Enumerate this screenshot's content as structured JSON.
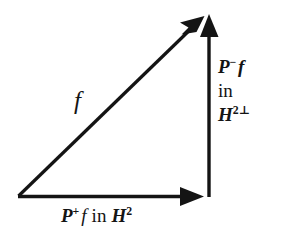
{
  "figure": {
    "type": "vector-triangle-diagram",
    "width": 290,
    "height": 241,
    "background_color": "#ffffff",
    "stroke_color": "#141414"
  },
  "geometry": {
    "origin": {
      "x": 18,
      "y": 196
    },
    "corner": {
      "x": 209,
      "y": 196
    },
    "apex": {
      "x": 209,
      "y": 15
    },
    "base_arrow_tip": {
      "x": 204,
      "y": 196
    },
    "vertical_arrow_tip": {
      "x": 209,
      "y": 14
    },
    "hypotenuse_arrow_tip": {
      "x": 204,
      "y": 16
    },
    "line_width": 3
  },
  "labels": {
    "hypotenuse": {
      "text": "f",
      "operator": "f",
      "style": "italic"
    },
    "base": {
      "full_text": "P+f in H2",
      "operator": "P",
      "operator_superscript": "+",
      "function": "f",
      "preposition": "in",
      "space": "H",
      "space_superscript": "2"
    },
    "vertical": {
      "full_text": "P-f in H2⊥",
      "line1_operator": "P",
      "line1_superscript": "−",
      "line1_function": "f",
      "line2_preposition": "in",
      "line3_space": "H",
      "line3_superscript": "2⊥"
    }
  },
  "elements": {
    "hypotenuse_name": "vector f",
    "base_name": "projection onto H2",
    "vertical_name": "projection onto H2 perp"
  }
}
